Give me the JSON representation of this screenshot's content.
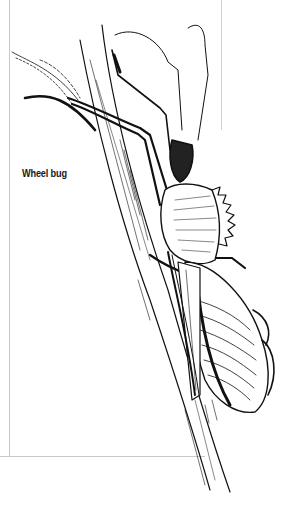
{
  "figure": {
    "caption": "Wheel bug",
    "style": "black ink line drawing",
    "colors": {
      "ink": "#111111",
      "frame": "#c8c8c8",
      "background": "#ffffff"
    }
  }
}
